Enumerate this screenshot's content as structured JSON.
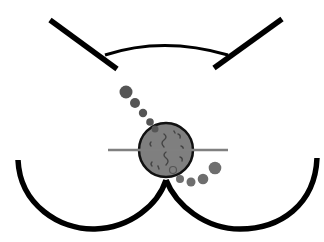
{
  "figure": {
    "type": "schematic-diagram",
    "colors": {
      "background": "#ffffff",
      "outline": "#000000",
      "mass_fill": "#7f7f7f",
      "mass_stroke": "#111111",
      "line": "#808080",
      "dots_upper": "#555555",
      "dots_lower": "#6e6e6e",
      "squiggle": "#444444"
    },
    "labels": []
  }
}
